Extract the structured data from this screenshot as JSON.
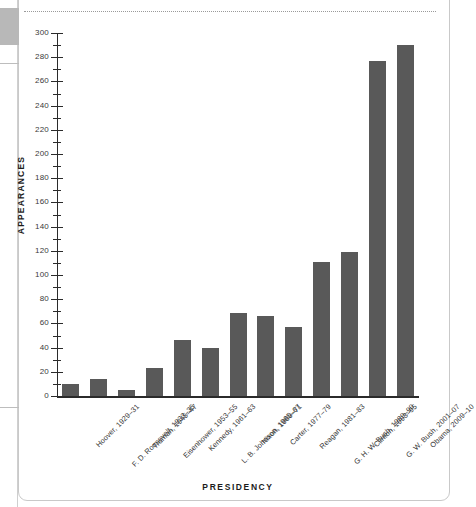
{
  "chart_data": {
    "type": "bar",
    "title": "",
    "xlabel": "PRESIDENCY",
    "ylabel": "APPEARANCES",
    "ylim": [
      0,
      300
    ],
    "grid": false,
    "legend": null,
    "y_major_step": 20,
    "y_minor_step": 10,
    "bar_color": "#595959",
    "categories": [
      "Hoover, 1929–31",
      "F. D. Roosevelt, 1933–35",
      "Truman, 1945–47",
      "Eisenhower, 1953–55",
      "Kennedy, 1961–63",
      "L. B. Johnson, 1965–67",
      "Nixon, 1969–71",
      "Carter, 1977–79",
      "Reagan, 1981–83",
      "G. H. W. Bush, 1989–90",
      "Clinton, 1993–95",
      "G. W. Bush, 2001–07",
      "Obama, 2009–10"
    ],
    "values": [
      10,
      14,
      5,
      23,
      46,
      40,
      69,
      66,
      57,
      111,
      119,
      277,
      290
    ],
    "y_tick_labels": [
      "0",
      "20",
      "40",
      "60",
      "80",
      "100",
      "120",
      "140",
      "160",
      "180",
      "200",
      "220",
      "240",
      "260",
      "280",
      "300"
    ]
  }
}
